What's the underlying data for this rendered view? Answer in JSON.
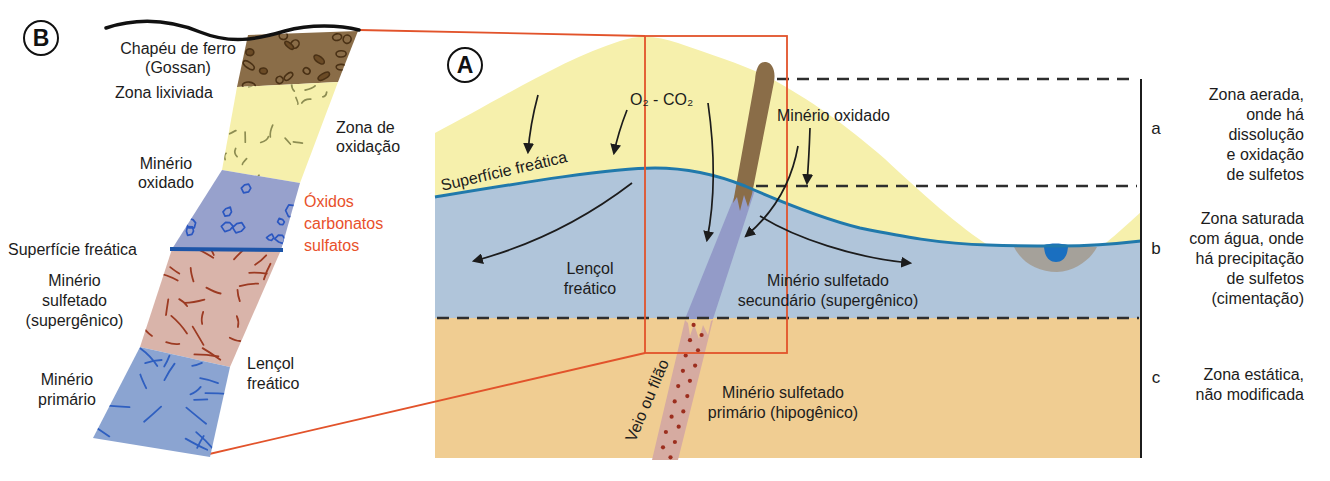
{
  "colors": {
    "zoom_line_red": "#e2532b",
    "oxide_text_orange": "#e8512b",
    "water_table_blue": "#2079ab",
    "oxidation_yellow": "#f6f0ac",
    "saturated_blue": "#b0c5da",
    "static_tan": "#f0cd92",
    "gossan_brown": "#8a6d48",
    "secondary_vein_blue": "#939bc8",
    "primary_vein_pink": "#d6aba1"
  },
  "panel_b": {
    "letter": "B",
    "gossan_label": [
      "Chapéu de ferro",
      "(Gossan)"
    ],
    "leached_label": "Zona lixiviada",
    "oxidation_zone_label": [
      "Zona de",
      "oxidação"
    ],
    "oxidized_ore_label": [
      "Minério",
      "oxidado"
    ],
    "oxides_label": [
      "Óxidos",
      "carbonatos",
      "sulfatos"
    ],
    "water_table_label": "Superfície freática",
    "supergene_label": [
      "Minério",
      "sulfetado",
      "(supergênico)"
    ],
    "phreatic_label": [
      "Lençol",
      "freático"
    ],
    "primary_ore_label": [
      "Minério",
      "primário"
    ]
  },
  "panel_a": {
    "letter": "A",
    "gases_label": "O₂ - CO₂",
    "water_table_label": "Superfície freática",
    "oxidized_ore_label": "Minério oxidado",
    "phreatic_label": [
      "Lençol",
      "freático"
    ],
    "secondary_ore_label": [
      "Minério sulfetado",
      "secundário (supergênico)"
    ],
    "vein_label": "Veio ou filão",
    "primary_ore_label": [
      "Minério sulfetado",
      "primário (hipogênico)"
    ]
  },
  "zones": {
    "a": {
      "letter": "a",
      "lines": [
        "Zona aerada,",
        "onde há",
        "dissolução",
        "e oxidação",
        "de sulfetos"
      ]
    },
    "b": {
      "letter": "b",
      "lines": [
        "Zona saturada",
        "com água, onde",
        "há precipitação",
        "de sulfetos",
        "(cimentação)"
      ]
    },
    "c": {
      "letter": "c",
      "lines": [
        "Zona estática,",
        "não modificada"
      ]
    }
  }
}
